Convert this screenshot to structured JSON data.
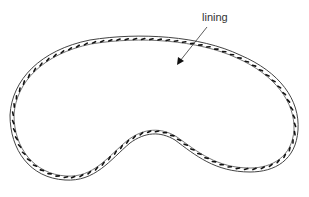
{
  "diagram": {
    "type": "illustration",
    "labels": [
      {
        "id": "lining",
        "text": "lining"
      }
    ],
    "colors": {
      "outline": "#444444",
      "inner_line": "#666666",
      "fasteners": "#111111",
      "arrow": "#333333",
      "background": "#ffffff"
    },
    "annotation": {
      "label": "lining",
      "arrow_from": [
        207,
        27
      ],
      "arrow_to": [
        177,
        65
      ]
    }
  }
}
